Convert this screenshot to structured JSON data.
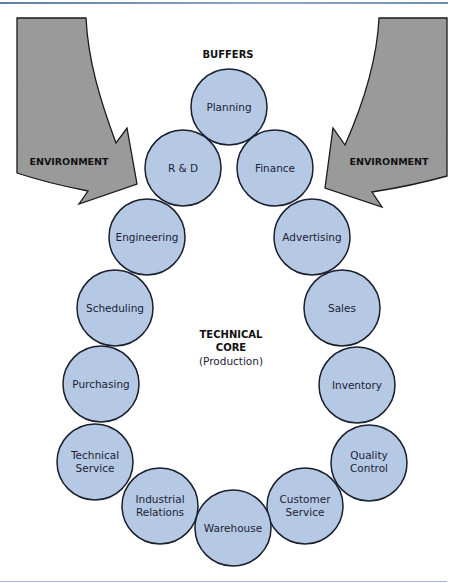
{
  "title": "BUFFERS",
  "colors": {
    "node_fill": "#b5c9e4",
    "node_stroke": "#1a1f2e",
    "arrow_fill": "#9a9a9a",
    "arrow_stroke": "#1a1a1a",
    "rule": "#7f9cc2"
  },
  "environment": {
    "left_label": "ENVIRONMENT",
    "right_label": "ENVIRONMENT"
  },
  "core": {
    "line1": "TECHNICAL",
    "line2": "CORE",
    "line3": "(Production)"
  },
  "nodes": [
    {
      "id": "planning",
      "lines": [
        "Planning"
      ]
    },
    {
      "id": "r-and-d",
      "lines": [
        "R & D"
      ]
    },
    {
      "id": "finance",
      "lines": [
        "Finance"
      ]
    },
    {
      "id": "engineering",
      "lines": [
        "Engineering"
      ]
    },
    {
      "id": "advertising",
      "lines": [
        "Advertising"
      ]
    },
    {
      "id": "scheduling",
      "lines": [
        "Scheduling"
      ]
    },
    {
      "id": "sales",
      "lines": [
        "Sales"
      ]
    },
    {
      "id": "purchasing",
      "lines": [
        "Purchasing"
      ]
    },
    {
      "id": "inventory",
      "lines": [
        "Inventory"
      ]
    },
    {
      "id": "technical-service",
      "lines": [
        "Technical",
        "Service"
      ]
    },
    {
      "id": "quality-control",
      "lines": [
        "Quality",
        "Control"
      ]
    },
    {
      "id": "industrial-relations",
      "lines": [
        "Industrial",
        "Relations"
      ]
    },
    {
      "id": "customer-service",
      "lines": [
        "Customer",
        "Service"
      ]
    },
    {
      "id": "warehouse",
      "lines": [
        "Warehouse"
      ]
    }
  ]
}
